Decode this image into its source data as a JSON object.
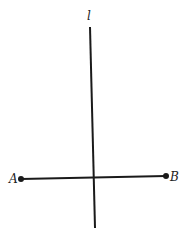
{
  "diagram": {
    "line_label": "l",
    "point_a_label": "A",
    "point_b_label": "B",
    "line_color": "#1a1a1a",
    "line_l": {
      "x1": 90,
      "y1": 27,
      "x2": 95,
      "y2": 228
    },
    "segment_ab": {
      "x1": 21,
      "y1": 179,
      "x2": 166,
      "y2": 176
    }
  }
}
